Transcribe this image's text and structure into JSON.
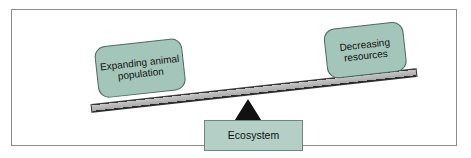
{
  "diagram": {
    "type": "balance-scale",
    "title_visible": false,
    "colors": {
      "node_fill": "#a4c6ba",
      "node_fill_base": "#b4cfc6",
      "node_border": "#4c6a62",
      "beam_fill": "#aaaaaa",
      "beam_edge": "#2e2e2e",
      "fulcrum_fill": "#111111",
      "frame_border": "#8c8c8c",
      "background": "#ffffff",
      "text": "#111111"
    },
    "beam": {
      "tilt_degrees": -6.3,
      "low_side": "left",
      "high_side": "right"
    },
    "nodes": {
      "left": {
        "label": "Expanding animal population",
        "lines": [
          "Expanding",
          "animal",
          "population"
        ],
        "shape": "rounded-rectangle",
        "position": "left-pan"
      },
      "right": {
        "label": "Decreasing resources",
        "lines": [
          "Decreasing",
          "resources"
        ],
        "shape": "rounded-rectangle",
        "position": "right-pan"
      },
      "base": {
        "label": "Ecosystem",
        "lines": [
          "Ecosystem"
        ],
        "shape": "rectangle",
        "position": "below-fulcrum"
      }
    },
    "fulcrum": {
      "shape": "triangle",
      "label": ""
    }
  }
}
